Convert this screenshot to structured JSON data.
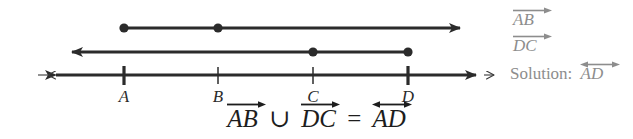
{
  "figure": {
    "type": "number-line-ray-union-diagram",
    "stroke_color": "#2b2b2b",
    "label_color": "#8d8d8d",
    "background": "#ffffff"
  },
  "points": [
    {
      "name": "A",
      "label": "A",
      "x": 124
    },
    {
      "name": "B",
      "label": "B",
      "x": 218
    },
    {
      "name": "C",
      "label": "C",
      "x": 313
    },
    {
      "name": "D",
      "label": "D",
      "x": 408
    }
  ],
  "rays": [
    {
      "name": "ray-AB",
      "y": 28,
      "direction": "right",
      "start_x": 124,
      "end_x": 466,
      "dots": [
        124,
        218
      ],
      "arrowhead": "right"
    },
    {
      "name": "ray-DC",
      "y": 52,
      "direction": "left",
      "start_x": 408,
      "end_x": 66,
      "dots": [
        313,
        408
      ],
      "arrowhead": "left"
    },
    {
      "name": "line-AD",
      "y": 75,
      "direction": "both",
      "start_x": 36,
      "end_x": 496,
      "dots": [],
      "arrowhead": "both"
    }
  ],
  "ticks": {
    "bold": [
      "A",
      "D"
    ],
    "thin": [
      "B",
      "C"
    ]
  },
  "side_labels": [
    {
      "name": "label-ray-ab",
      "text": "AB",
      "arrow": "right",
      "x": 513,
      "y": 10
    },
    {
      "name": "label-ray-dc",
      "text": "DC",
      "arrow": "right",
      "x": 513,
      "y": 36
    }
  ],
  "solution": {
    "prefix": "Solution:",
    "segment": "AD",
    "arrow": "both",
    "x": 510,
    "y": 64
  },
  "equation": {
    "left_term": "AB",
    "left_arrow": "right",
    "operator": "∪",
    "right_term": "DC",
    "right_arrow": "right",
    "equals": "=",
    "result_term": "AD",
    "result_arrow": "both"
  }
}
